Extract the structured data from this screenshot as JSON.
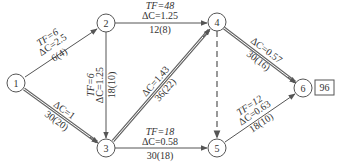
{
  "diagram": {
    "type": "activity-on-arrow network",
    "nodes": [
      {
        "id": "1",
        "x": 16,
        "y": 83
      },
      {
        "id": "2",
        "x": 106,
        "y": 23
      },
      {
        "id": "3",
        "x": 106,
        "y": 148
      },
      {
        "id": "4",
        "x": 217,
        "y": 22
      },
      {
        "id": "5",
        "x": 217,
        "y": 148
      },
      {
        "id": "6",
        "x": 303,
        "y": 88
      }
    ],
    "edges": [
      {
        "from": "1",
        "to": "2",
        "style": "single",
        "tf": "TF=6",
        "dc": "ΔC=2.5",
        "duration": "6(4)"
      },
      {
        "from": "1",
        "to": "3",
        "style": "double",
        "tf": "",
        "dc": "ΔC=1",
        "duration": "30(20)"
      },
      {
        "from": "2",
        "to": "3",
        "style": "single",
        "tf": "TF=6",
        "dc": "ΔC=1.25",
        "duration": "18(10)"
      },
      {
        "from": "2",
        "to": "4",
        "style": "single",
        "tf": "TF=48",
        "dc": "ΔC=1.25",
        "duration": "12(8)"
      },
      {
        "from": "3",
        "to": "4",
        "style": "double",
        "tf": "",
        "dc": "ΔC=1.43",
        "duration": "36(22)"
      },
      {
        "from": "3",
        "to": "5",
        "style": "single",
        "tf": "TF=18",
        "dc": "ΔC=0.58",
        "duration": "30(18)"
      },
      {
        "from": "4",
        "to": "5",
        "style": "dashed",
        "tf": "",
        "dc": "",
        "duration": ""
      },
      {
        "from": "4",
        "to": "6",
        "style": "double",
        "tf": "",
        "dc": "ΔC=0.57",
        "duration": "30(16)"
      },
      {
        "from": "5",
        "to": "6",
        "style": "single",
        "tf": "TF=12",
        "dc": "ΔC=0.63",
        "duration": "18(10)"
      }
    ],
    "total_duration_box": "96"
  }
}
